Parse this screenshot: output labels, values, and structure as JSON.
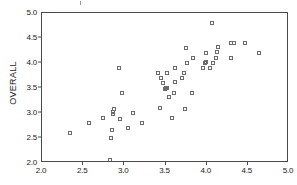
{
  "chart_data": {
    "type": "scatter",
    "title": "",
    "xlabel": "",
    "ylabel": "OVERALL",
    "xlim": [
      2.0,
      5.0
    ],
    "ylim": [
      2.0,
      5.0
    ],
    "grid": false,
    "legend": null,
    "marker": "open-square",
    "x_ticks": [
      "2.0",
      "2.5",
      "3.0",
      "3.5",
      "4.0",
      "4.5",
      "5.0"
    ],
    "x_tick_values": [
      2.0,
      2.5,
      3.0,
      3.5,
      4.0,
      4.5,
      5.0
    ],
    "y_ticks": [
      "2.0",
      "2.5",
      "3.0",
      "3.5",
      "4.0",
      "4.5",
      "5.0"
    ],
    "y_tick_values": [
      2.0,
      2.5,
      3.0,
      3.5,
      4.0,
      4.5,
      5.0
    ],
    "points": [
      [
        2.34,
        2.6
      ],
      [
        2.57,
        2.8
      ],
      [
        2.74,
        2.9
      ],
      [
        2.83,
        2.06
      ],
      [
        2.84,
        2.5
      ],
      [
        2.85,
        2.67
      ],
      [
        2.86,
        2.98
      ],
      [
        2.86,
        3.02
      ],
      [
        2.88,
        3.08
      ],
      [
        2.94,
        3.91
      ],
      [
        2.95,
        2.89
      ],
      [
        2.97,
        3.4
      ],
      [
        3.04,
        2.7
      ],
      [
        3.11,
        3.0
      ],
      [
        3.21,
        2.8
      ],
      [
        3.41,
        3.8
      ],
      [
        3.43,
        3.1
      ],
      [
        3.45,
        3.7
      ],
      [
        3.47,
        3.6
      ],
      [
        3.49,
        3.49
      ],
      [
        3.5,
        3.5
      ],
      [
        3.52,
        3.5
      ],
      [
        3.52,
        3.81
      ],
      [
        3.54,
        3.32
      ],
      [
        3.58,
        2.9
      ],
      [
        3.6,
        3.4
      ],
      [
        3.61,
        3.62
      ],
      [
        3.62,
        3.9
      ],
      [
        3.7,
        3.71
      ],
      [
        3.72,
        3.8
      ],
      [
        3.74,
        3.09
      ],
      [
        3.75,
        4.31
      ],
      [
        3.76,
        4.0
      ],
      [
        3.82,
        3.4
      ],
      [
        3.84,
        4.1
      ],
      [
        3.96,
        3.9
      ],
      [
        3.98,
        4.01
      ],
      [
        3.99,
        4.03
      ],
      [
        3.99,
        4.21
      ],
      [
        4.04,
        3.9
      ],
      [
        4.07,
        4.8
      ],
      [
        4.08,
        4.01
      ],
      [
        4.11,
        4.1
      ],
      [
        4.13,
        4.22
      ],
      [
        4.14,
        4.33
      ],
      [
        4.3,
        4.11
      ],
      [
        4.3,
        4.41
      ],
      [
        4.33,
        4.41
      ],
      [
        4.47,
        4.41
      ],
      [
        4.63,
        4.21
      ]
    ]
  }
}
